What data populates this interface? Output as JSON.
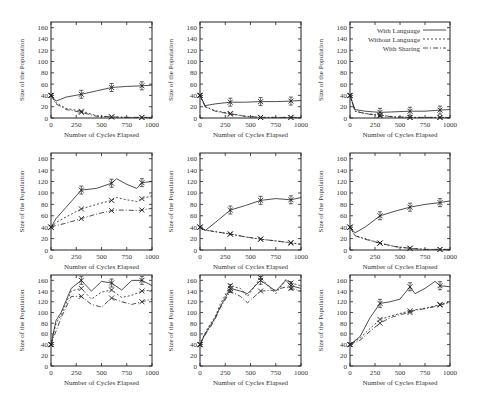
{
  "chart_data": [
    {
      "type": "line",
      "panel": "row1-col1",
      "xlabel": "Number of Cycles Elapsed",
      "ylabel": "Size of the Population",
      "xlim": [
        0,
        1000
      ],
      "ylim": [
        0,
        170
      ],
      "x": [
        0,
        50,
        150,
        300,
        450,
        600,
        750,
        900,
        1000
      ],
      "series": [
        {
          "name": "With Language",
          "values": [
            40,
            30,
            37,
            42,
            48,
            54,
            56,
            57,
            58
          ]
        },
        {
          "name": "Without Language",
          "values": [
            40,
            27,
            17,
            12,
            4,
            2,
            1,
            1,
            1
          ]
        },
        {
          "name": "With Sharing",
          "values": [
            40,
            25,
            15,
            10,
            3,
            2,
            1,
            1,
            1
          ]
        }
      ]
    },
    {
      "type": "line",
      "panel": "row1-col2",
      "xlabel": "Number of Cycles Elapsed",
      "ylabel": "Size of the Population",
      "xlim": [
        0,
        1000
      ],
      "ylim": [
        0,
        170
      ],
      "x": [
        0,
        50,
        150,
        300,
        450,
        600,
        750,
        900,
        1000
      ],
      "series": [
        {
          "name": "With Language",
          "values": [
            40,
            22,
            25,
            28,
            28,
            29,
            29,
            30,
            31
          ]
        },
        {
          "name": "Without Language",
          "values": [
            40,
            20,
            13,
            8,
            3,
            1,
            1,
            1,
            1
          ]
        },
        {
          "name": "With Sharing",
          "values": [
            40,
            20,
            12,
            7,
            3,
            1,
            1,
            1,
            1
          ]
        }
      ]
    },
    {
      "type": "line",
      "panel": "row1-col3",
      "xlabel": "Number of Cycles Elapsed",
      "ylabel": "Size of the Population",
      "xlim": [
        0,
        1000
      ],
      "ylim": [
        0,
        170
      ],
      "legend": [
        "With Language",
        "Without Language",
        "With Sharing"
      ],
      "x": [
        0,
        50,
        150,
        300,
        450,
        600,
        750,
        900,
        1000
      ],
      "series": [
        {
          "name": "With Language",
          "values": [
            40,
            15,
            12,
            10,
            11,
            12,
            12,
            14,
            15
          ]
        },
        {
          "name": "Without Language",
          "values": [
            40,
            12,
            8,
            5,
            2,
            1,
            1,
            1,
            1
          ]
        },
        {
          "name": "With Sharing",
          "values": [
            40,
            12,
            8,
            4,
            2,
            1,
            1,
            1,
            1
          ]
        }
      ]
    },
    {
      "type": "line",
      "panel": "row2-col1",
      "xlabel": "Number of Cycles Elapsed",
      "ylabel": "Size of the Population",
      "xlim": [
        0,
        1000
      ],
      "ylim": [
        0,
        170
      ],
      "x": [
        0,
        50,
        150,
        300,
        450,
        600,
        650,
        750,
        850,
        900,
        1000
      ],
      "series": [
        {
          "name": "With Language",
          "values": [
            40,
            55,
            75,
            105,
            108,
            117,
            125,
            115,
            108,
            118,
            120
          ]
        },
        {
          "name": "Without Language",
          "values": [
            40,
            48,
            58,
            72,
            80,
            87,
            92,
            88,
            85,
            90,
            95
          ]
        },
        {
          "name": "With Sharing",
          "values": [
            40,
            43,
            47,
            55,
            63,
            69,
            70,
            70,
            69,
            70,
            73
          ]
        }
      ]
    },
    {
      "type": "line",
      "panel": "row2-col2",
      "xlabel": "Number of Cycles Elapsed",
      "ylabel": "Size of the Population",
      "xlim": [
        0,
        1000
      ],
      "ylim": [
        0,
        170
      ],
      "x": [
        0,
        50,
        150,
        300,
        450,
        600,
        750,
        900,
        1000
      ],
      "series": [
        {
          "name": "With Language",
          "values": [
            40,
            34,
            48,
            70,
            78,
            87,
            90,
            88,
            92
          ]
        },
        {
          "name": "Without Language",
          "values": [
            40,
            35,
            32,
            28,
            23,
            19,
            16,
            13,
            10
          ]
        },
        {
          "name": "With Sharing",
          "values": [
            40,
            35,
            32,
            28,
            23,
            19,
            16,
            12,
            10
          ]
        }
      ]
    },
    {
      "type": "line",
      "panel": "row2-col3",
      "xlabel": "Number of Cycles Elapsed",
      "ylabel": "Size of the Population",
      "xlim": [
        0,
        1000
      ],
      "ylim": [
        0,
        170
      ],
      "x": [
        0,
        50,
        150,
        300,
        450,
        600,
        750,
        900,
        1000
      ],
      "series": [
        {
          "name": "With Language",
          "values": [
            40,
            30,
            40,
            60,
            68,
            75,
            80,
            83,
            86
          ]
        },
        {
          "name": "Without Language",
          "values": [
            40,
            25,
            20,
            12,
            6,
            3,
            1,
            1,
            1
          ]
        },
        {
          "name": "With Sharing",
          "values": [
            40,
            25,
            19,
            12,
            6,
            3,
            1,
            1,
            1
          ]
        }
      ]
    },
    {
      "type": "line",
      "panel": "row3-col1",
      "xlabel": "Number of Cycles Elapsed",
      "ylabel": "Size of the Population",
      "xlim": [
        0,
        1000
      ],
      "ylim": [
        0,
        170
      ],
      "x": [
        0,
        50,
        100,
        200,
        300,
        400,
        500,
        600,
        700,
        800,
        900,
        1000
      ],
      "series": [
        {
          "name": "With Language",
          "values": [
            40,
            85,
            100,
            145,
            160,
            140,
            158,
            155,
            142,
            160,
            160,
            150
          ]
        },
        {
          "name": "Without Language",
          "values": [
            40,
            80,
            95,
            140,
            145,
            125,
            138,
            142,
            128,
            132,
            140,
            142
          ]
        },
        {
          "name": "With Sharing",
          "values": [
            40,
            65,
            90,
            130,
            130,
            115,
            110,
            127,
            120,
            115,
            120,
            125
          ]
        }
      ]
    },
    {
      "type": "line",
      "panel": "row3-col2",
      "xlabel": "Number of Cycles Elapsed",
      "ylabel": "Size of the Population",
      "xlim": [
        0,
        1000
      ],
      "ylim": [
        0,
        170
      ],
      "x": [
        0,
        50,
        100,
        150,
        200,
        300,
        400,
        470,
        600,
        750,
        850,
        900,
        1000
      ],
      "series": [
        {
          "name": "With Language",
          "values": [
            40,
            60,
            75,
            90,
            110,
            145,
            140,
            135,
            160,
            140,
            160,
            150,
            145
          ]
        },
        {
          "name": "Without Language",
          "values": [
            40,
            62,
            78,
            92,
            115,
            150,
            145,
            130,
            165,
            135,
            162,
            155,
            150
          ]
        },
        {
          "name": "With Sharing",
          "values": [
            40,
            58,
            72,
            88,
            108,
            140,
            130,
            118,
            140,
            142,
            148,
            145,
            140
          ]
        }
      ]
    },
    {
      "type": "line",
      "panel": "row3-col3",
      "xlabel": "Number of Cycles Elapsed",
      "ylabel": "Size of the Population",
      "xlim": [
        0,
        1000
      ],
      "ylim": [
        0,
        170
      ],
      "x": [
        0,
        100,
        200,
        300,
        400,
        500,
        600,
        650,
        750,
        850,
        900,
        1000
      ],
      "series": [
        {
          "name": "With Language",
          "values": [
            40,
            55,
            90,
            117,
            120,
            125,
            148,
            135,
            145,
            158,
            150,
            148
          ]
        },
        {
          "name": "Without Language",
          "values": [
            40,
            52,
            70,
            87,
            93,
            98,
            103,
            105,
            108,
            112,
            115,
            120
          ]
        },
        {
          "name": "With Sharing",
          "values": [
            40,
            48,
            65,
            80,
            90,
            96,
            100,
            104,
            107,
            111,
            114,
            118
          ]
        }
      ]
    }
  ],
  "axes": {
    "xlabel": "Number of Cycles Elapsed",
    "ylabel": "Size of the Population",
    "xticks": [
      "0",
      "250",
      "500",
      "750",
      "1000"
    ],
    "yticks": [
      "0",
      "20",
      "40",
      "60",
      "80",
      "100",
      "120",
      "140",
      "160"
    ]
  },
  "legend": {
    "items": [
      "With Language",
      "Without Language",
      "With Sharing"
    ]
  }
}
